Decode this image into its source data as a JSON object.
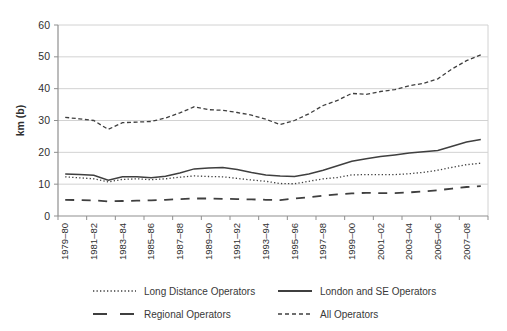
{
  "chart_data": {
    "type": "line",
    "title": "",
    "xlabel": "",
    "ylabel": "km (b)",
    "ylim": [
      0,
      60
    ],
    "yticks": [
      0,
      10,
      20,
      30,
      40,
      50,
      60
    ],
    "grid": "horizontal",
    "legend_position": "bottom",
    "x_categories": [
      "1979–80",
      "1980–81",
      "1981–82",
      "1982–83",
      "1983–84",
      "1984–85",
      "1985–86",
      "1986–87",
      "1987–88",
      "1988–89",
      "1989–90",
      "1990–91",
      "1991–92",
      "1992–93",
      "1993–94",
      "1994–95",
      "1995–96",
      "1996–97",
      "1997–98",
      "1998–99",
      "1999–00",
      "2000–01",
      "2001–02",
      "2002–03",
      "2003–04",
      "2004–05",
      "2005–06",
      "2006–07",
      "2007–08",
      "2008–09"
    ],
    "x_tick_labels": [
      "1979–80",
      "1981–82",
      "1983–84",
      "1985–86",
      "1987–88",
      "1989–90",
      "1991–92",
      "1993–94",
      "1995–96",
      "1997–98",
      "1999–00",
      "2001–02",
      "2003–04",
      "2005–06",
      "2007–08"
    ],
    "series": [
      {
        "name": "Long Distance Operators",
        "style": "dotted",
        "values": [
          12.3,
          12.0,
          11.7,
          10.7,
          11.5,
          11.7,
          11.4,
          11.7,
          12.2,
          12.6,
          12.4,
          12.3,
          11.8,
          11.3,
          10.9,
          10.2,
          10.1,
          10.9,
          11.7,
          12.1,
          12.9,
          13.0,
          13.0,
          13.0,
          13.3,
          13.7,
          14.4,
          15.3,
          16.1,
          16.6
        ]
      },
      {
        "name": "London and SE Operators",
        "style": "solid",
        "values": [
          13.2,
          13.0,
          12.8,
          11.2,
          12.3,
          12.3,
          12.0,
          12.5,
          13.5,
          14.8,
          15.1,
          15.2,
          14.6,
          13.7,
          12.9,
          12.6,
          12.4,
          13.2,
          14.4,
          15.8,
          17.2,
          18.0,
          18.7,
          19.2,
          19.8,
          20.2,
          20.6,
          21.9,
          23.2,
          24.0
        ]
      },
      {
        "name": "Regional Operators",
        "style": "long-dash",
        "values": [
          5.1,
          5.0,
          4.9,
          4.6,
          4.7,
          4.8,
          4.9,
          5.1,
          5.3,
          5.5,
          5.5,
          5.4,
          5.3,
          5.2,
          5.1,
          5.0,
          5.5,
          5.9,
          6.4,
          6.8,
          7.1,
          7.3,
          7.2,
          7.2,
          7.4,
          7.7,
          8.1,
          8.6,
          9.1,
          9.4
        ]
      },
      {
        "name": "All Operators",
        "style": "short-dash",
        "values": [
          31.0,
          30.5,
          30.0,
          27.2,
          29.3,
          29.5,
          29.7,
          30.8,
          32.4,
          34.3,
          33.4,
          33.2,
          32.5,
          31.7,
          30.4,
          28.7,
          30.0,
          32.1,
          34.7,
          36.3,
          38.5,
          38.2,
          39.1,
          39.7,
          40.9,
          41.7,
          43.1,
          46.2,
          48.8,
          50.6
        ]
      }
    ],
    "colors": {
      "line": "#3f3f3f",
      "grid": "#d2d2d2",
      "axis": "#8f8f8f",
      "text": "#2f2f2f",
      "background": "#ffffff"
    }
  },
  "legend": {
    "rows": [
      [
        "Long Distance Operators",
        "London and SE Operators"
      ],
      [
        "Regional Operators",
        "All Operators"
      ]
    ]
  }
}
